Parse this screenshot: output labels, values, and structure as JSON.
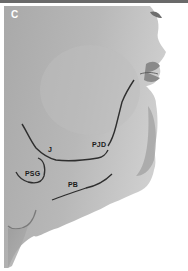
{
  "figure": {
    "panel_letter": "C",
    "labels": {
      "j": "J",
      "pjd": "PJD",
      "psg": "PSG",
      "pb": "PB"
    },
    "colors": {
      "skin": "#b4b4b4",
      "skin_light": "#c8c8c8",
      "skin_dark": "#8e8e8e",
      "line": "#2e2e2e",
      "background": "#ffffff"
    }
  }
}
